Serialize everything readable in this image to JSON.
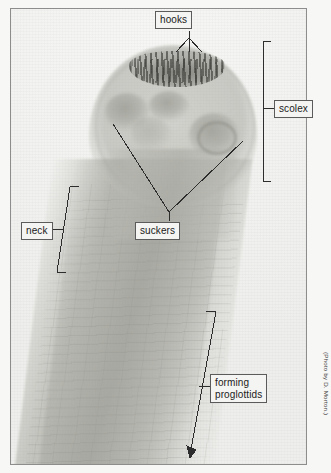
{
  "figure": {
    "kind": "labeled-photomicrograph",
    "credit": "(Photo by D. Morton.)",
    "frame": {
      "border_color": "#8d8d8d",
      "background": "#f2f2f0"
    },
    "page_background": "#f7f7f5",
    "label_style": {
      "box_border": "#5b5b5b",
      "box_fill": "#f4f4f2",
      "text_color": "#1b1b1b"
    },
    "leader_color": "#2d2d2d"
  },
  "labels": [
    {
      "id": "hooks",
      "text": "hooks",
      "pointer": "fan-of-three-lines-down"
    },
    {
      "id": "scolex",
      "text": "scolex",
      "pointer": "vertical-bracket-left"
    },
    {
      "id": "neck",
      "text": "neck",
      "pointer": "slanted-bracket-right"
    },
    {
      "id": "suckers",
      "text": "suckers",
      "pointer": "v-shaped-two-lines-up"
    },
    {
      "id": "proglottids",
      "text": "forming\nproglottids",
      "pointer": "slanted-bracket-with-arrow-left"
    }
  ],
  "anatomy": [
    {
      "name": "hooks",
      "description": "dark crown of spines at apex of scolex"
    },
    {
      "name": "suckers",
      "description": "four pale circular blotches on the scolex"
    },
    {
      "name": "scolex",
      "description": "bulbous head region, bracketed on the right"
    },
    {
      "name": "neck",
      "description": "narrow unsegmented region below the scolex"
    },
    {
      "name": "forming proglottids",
      "description": "young segments appearing along the strobila"
    }
  ]
}
